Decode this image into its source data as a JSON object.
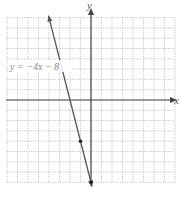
{
  "chart_data": {
    "type": "line",
    "title": "",
    "xlabel": "x",
    "ylabel": "y",
    "xlim": [
      -8,
      8
    ],
    "ylim": [
      -8,
      8
    ],
    "grid": true,
    "series": [
      {
        "name": "y = -4x - 8",
        "equation": "y = -4x - 8",
        "slope": -4,
        "intercept": -8,
        "points": [
          [
            -1,
            -4
          ],
          [
            0,
            -8
          ]
        ],
        "x_range": [
          -4,
          0.05
        ]
      }
    ],
    "annotations": [
      {
        "text": "y = −4x − 8",
        "x": -7.7,
        "y": 2.6
      }
    ]
  },
  "labels": {
    "x_axis": "x",
    "y_axis": "y",
    "equation": "y = −4x − 8"
  },
  "colors": {
    "grid": "#b8b8b8",
    "axis": "#444444",
    "line": "#555555",
    "label": "#777777"
  }
}
